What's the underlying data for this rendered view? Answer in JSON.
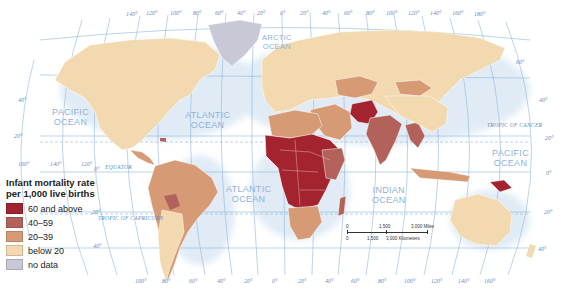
{
  "legend": {
    "title_line1": "Infant mortality rate",
    "title_line2": "per 1,000 live births",
    "items": [
      {
        "label": "60 and above",
        "color": "#a3232e"
      },
      {
        "label": "40–59",
        "color": "#b2625a"
      },
      {
        "label": "20–39",
        "color": "#d69a74"
      },
      {
        "label": "below 20",
        "color": "#f2d9b0"
      },
      {
        "label": "no data",
        "color": "#c9c8d6"
      }
    ]
  },
  "oceans": {
    "pacific_west": [
      "PACIFIC",
      "OCEAN"
    ],
    "atlantic_north": [
      "ATLANTIC",
      "OCEAN"
    ],
    "arctic": [
      "ARCTIC",
      "OCEAN"
    ],
    "atlantic_south": [
      "ATLANTIC",
      "OCEAN"
    ],
    "indian": [
      "INDIAN",
      "OCEAN"
    ],
    "pacific_east": [
      "PACIFIC",
      "OCEAN"
    ]
  },
  "lines": {
    "equator": "EQUATOR",
    "tropic_cancer": "TROPIC OF CANCER",
    "tropic_capricorn": "TROPIC OF CAPRICORN"
  },
  "graticule": {
    "top_longitudes": [
      "140°",
      "120°",
      "100°",
      "80°",
      "60°",
      "40°",
      "20°",
      "0°",
      "20°",
      "40°",
      "60°",
      "80°",
      "100°",
      "120°",
      "140°",
      "160°",
      "180°"
    ],
    "bottom_longitudes": [
      "100°",
      "80°",
      "60°",
      "40°",
      "20°",
      "0°",
      "20°",
      "40°",
      "60°",
      "80°",
      "100°",
      "120°",
      "140°",
      "160°",
      "180°"
    ],
    "left_latitudes": [
      "40°",
      "20°",
      "0°",
      "20°",
      "40°"
    ],
    "right_latitudes": [
      "60°",
      "40°",
      "20°",
      "0°",
      "20°",
      "40°"
    ],
    "lon_160": "160°",
    "lon_140": "140°",
    "lon_120": "120°"
  },
  "scale_bar": {
    "miles_labels": [
      "0",
      "1,500",
      "3,000 Miles"
    ],
    "km_labels": [
      "0",
      "1,500",
      "3,000 Kilometers"
    ]
  }
}
